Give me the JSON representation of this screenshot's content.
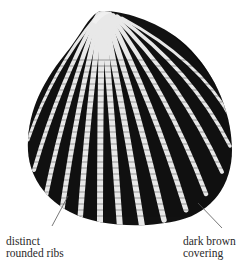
{
  "figure": {
    "colors": {
      "ink": "#111111",
      "background": "#ffffff",
      "leader_line": "#555555",
      "label_text": "#2a2a2a"
    }
  },
  "annotations": [
    {
      "id": "ribs",
      "line1": "distinct",
      "line2": "rounded ribs"
    },
    {
      "id": "covering",
      "line1": "dark brown",
      "line2": "covering"
    }
  ]
}
